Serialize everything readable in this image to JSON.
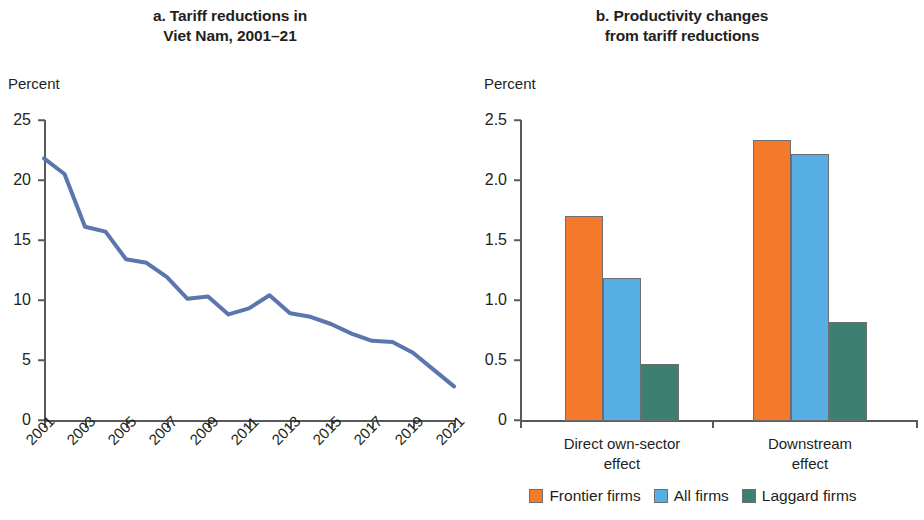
{
  "figure": {
    "panel_a": {
      "title_line1": "a. Tariff reductions in",
      "title_line2": "Viet Nam, 2001–21",
      "axis_unit": "Percent"
    },
    "panel_b": {
      "title_line1": "b. Productivity changes",
      "title_line2": "from tariff reductions",
      "axis_unit": "Percent"
    }
  },
  "legend": {
    "items": [
      {
        "label": "Frontier firms",
        "color": "#f4792a"
      },
      {
        "label": "All firms",
        "color": "#56aee2"
      },
      {
        "label": "Laggard firms",
        "color": "#3d7f70"
      }
    ]
  },
  "chart_data": [
    {
      "type": "line",
      "title": "a. Tariff reductions in Viet Nam, 2001–21",
      "xlabel": "",
      "ylabel": "Percent",
      "ylim": [
        0,
        25
      ],
      "yticks": [
        0,
        5,
        10,
        15,
        20,
        25
      ],
      "ytick_labels": [
        "0",
        "5",
        "10",
        "15",
        "20",
        "25"
      ],
      "xlim": [
        2001,
        2021
      ],
      "xticks": [
        2001,
        2003,
        2005,
        2007,
        2009,
        2011,
        2013,
        2015,
        2017,
        2019,
        2021
      ],
      "xtick_labels": [
        "2001",
        "2003",
        "2005",
        "2007",
        "2009",
        "2011",
        "2013",
        "2015",
        "2017",
        "2019",
        "2021"
      ],
      "xtick_rotation": -45,
      "grid": false,
      "legend": "none",
      "series": [
        {
          "name": "Average tariff",
          "color": "#5b75ad",
          "x": [
            2001,
            2002,
            2003,
            2004,
            2005,
            2006,
            2007,
            2008,
            2009,
            2010,
            2011,
            2012,
            2013,
            2014,
            2015,
            2016,
            2017,
            2018,
            2019,
            2020,
            2021
          ],
          "values": [
            21.8,
            20.5,
            16.1,
            15.7,
            13.4,
            13.1,
            11.9,
            10.1,
            10.3,
            8.8,
            9.3,
            10.4,
            8.9,
            8.6,
            8.0,
            7.2,
            6.6,
            6.5,
            5.6,
            4.2,
            2.8
          ]
        }
      ]
    },
    {
      "type": "bar",
      "title": "b. Productivity changes from tariff reductions",
      "xlabel": "",
      "ylabel": "Percent",
      "ylim": [
        0,
        2.5
      ],
      "yticks": [
        0,
        0.5,
        1.0,
        1.5,
        2.0,
        2.5
      ],
      "ytick_labels": [
        "0",
        "0.5",
        "1.0",
        "1.5",
        "2.0",
        "2.5"
      ],
      "grid": false,
      "legend_position": "bottom",
      "categories": [
        "Direct own-sector effect",
        "Downstream effect"
      ],
      "category_lines": [
        [
          "Direct own-sector",
          "effect"
        ],
        [
          "Downstream",
          "effect"
        ]
      ],
      "series": [
        {
          "name": "Frontier firms",
          "color": "#f4792a",
          "values": [
            1.7,
            2.33
          ]
        },
        {
          "name": "All firms",
          "color": "#56aee2",
          "values": [
            1.18,
            2.22
          ]
        },
        {
          "name": "Laggard firms",
          "color": "#3d7f70",
          "values": [
            0.47,
            0.82
          ]
        }
      ]
    }
  ]
}
